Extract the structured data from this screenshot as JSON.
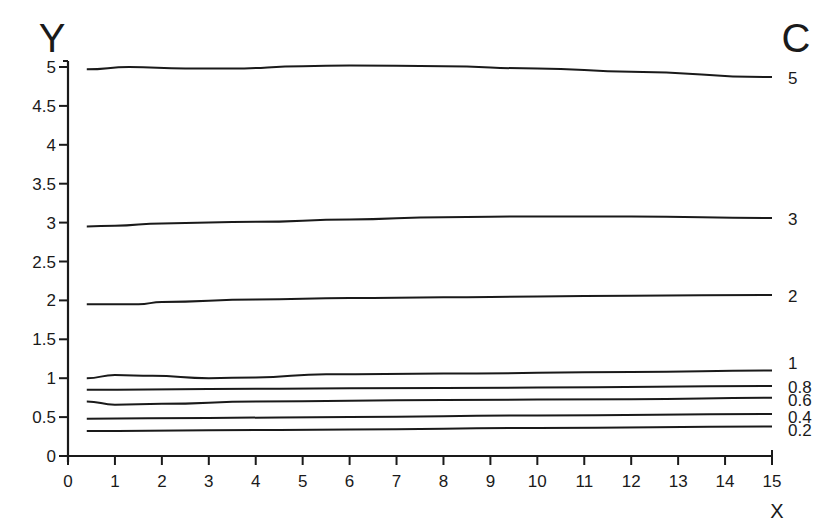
{
  "chart_data": {
    "type": "line",
    "title": "",
    "xlabel": "X",
    "ylabel": "Y",
    "legend_title": "C",
    "xlim": [
      0,
      15
    ],
    "ylim": [
      0,
      5
    ],
    "grid": false,
    "legend_position": "right, labels at line ends",
    "x_ticks": [
      "0",
      "1",
      "2",
      "3",
      "4",
      "5",
      "6",
      "7",
      "8",
      "9",
      "10",
      "11",
      "12",
      "13",
      "14",
      "15"
    ],
    "y_ticks": [
      "0",
      "0.5",
      "1",
      "1.5",
      "2",
      "2.5",
      "3",
      "3.5",
      "4",
      "4.5",
      "5"
    ],
    "series": [
      {
        "name": "5",
        "x": [
          0.4,
          1.3,
          2.5,
          3.5,
          5,
          6,
          8,
          10,
          12,
          15
        ],
        "y": [
          4.97,
          5.0,
          4.98,
          4.98,
          5.01,
          5.02,
          5.01,
          4.98,
          4.94,
          4.87
        ]
      },
      {
        "name": "3",
        "x": [
          0.4,
          1,
          2,
          4,
          6,
          8,
          10,
          12,
          15
        ],
        "y": [
          2.95,
          2.96,
          2.99,
          3.01,
          3.04,
          3.07,
          3.08,
          3.08,
          3.06
        ]
      },
      {
        "name": "2",
        "x": [
          0.4,
          1.5,
          2,
          4,
          6,
          8,
          10,
          12,
          15
        ],
        "y": [
          1.95,
          1.95,
          1.98,
          2.01,
          2.03,
          2.04,
          2.05,
          2.06,
          2.07
        ]
      },
      {
        "name": "1",
        "x": [
          0.4,
          1,
          1.8,
          3,
          4,
          5.5,
          8,
          12,
          15
        ],
        "y": [
          1.0,
          1.04,
          1.03,
          1.0,
          1.01,
          1.05,
          1.06,
          1.08,
          1.1
        ]
      },
      {
        "name": "0.8",
        "x": [
          0.4,
          3,
          6,
          10,
          15
        ],
        "y": [
          0.85,
          0.86,
          0.87,
          0.88,
          0.9
        ]
      },
      {
        "name": "0.6",
        "x": [
          0.4,
          1,
          2,
          4,
          8,
          12,
          15
        ],
        "y": [
          0.7,
          0.66,
          0.67,
          0.7,
          0.72,
          0.73,
          0.75
        ]
      },
      {
        "name": "0.4",
        "x": [
          0.4,
          3,
          6,
          10,
          15
        ],
        "y": [
          0.48,
          0.49,
          0.5,
          0.52,
          0.54
        ]
      },
      {
        "name": "0.2",
        "x": [
          0.4,
          3,
          6,
          10,
          15
        ],
        "y": [
          0.32,
          0.33,
          0.34,
          0.36,
          0.38
        ]
      }
    ]
  },
  "labels": {
    "y_axis": "Y",
    "x_axis": "X",
    "curve_param": "C"
  },
  "colors": {
    "line": "#1a1a1a",
    "background": "#ffffff"
  }
}
